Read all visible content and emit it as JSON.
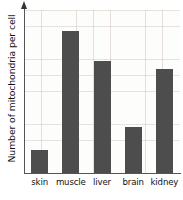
{
  "chart_data": {
    "type": "bar",
    "title": "",
    "subtitle": "",
    "xlabel": "",
    "ylabel": "Number of mitochondria per cell",
    "categories": [
      "skin",
      "muscle",
      "liver",
      "brain",
      "kidney"
    ],
    "values": [
      14,
      87,
      69,
      28,
      64
    ],
    "ylim": [
      0,
      100
    ],
    "y_tick_labels": [],
    "x_tick_labels": [
      "skin",
      "muscle",
      "liver",
      "brain",
      "kidney"
    ],
    "grid": true,
    "legend": false,
    "legend_position": "none",
    "annotations": [],
    "series": [
      {
        "name": "Number of mitochondria per cell",
        "values": [
          14,
          87,
          69,
          28,
          64
        ]
      }
    ],
    "bar_color": "#4d4d4d",
    "axis_color": "#555555",
    "grid_color": "#c4b4b4",
    "background_color": "#fdfdfc"
  },
  "axes": {
    "y_axis_title": "Number of mitochondria per cell",
    "y_axis_has_arrow": true,
    "x_axis_title": ""
  }
}
